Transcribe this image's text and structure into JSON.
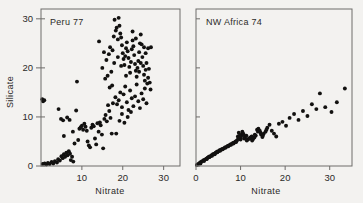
{
  "figure": {
    "background_color": "#f3f2f0",
    "ink_color": "#121110",
    "axis_color": "#6e6c6a"
  },
  "chart_data": [
    {
      "type": "scatter",
      "title": "Peru 77",
      "xlabel": "Nitrate",
      "ylabel": "Silicate",
      "xlim": [
        0,
        34
      ],
      "ylim": [
        0,
        32
      ],
      "xticks": [
        10,
        20,
        30
      ],
      "xticklabels": [
        "10",
        "20",
        "30"
      ],
      "yticks": [
        0,
        10,
        20,
        30
      ],
      "yticklabels": [
        "0",
        "10",
        "20",
        "30"
      ],
      "grid": false,
      "legend": null,
      "marker": "filled-circle",
      "points": [
        [
          0.3,
          13.6
        ],
        [
          0.5,
          13.2
        ],
        [
          0.8,
          13.4
        ],
        [
          0.4,
          0.4
        ],
        [
          0.9,
          0.5
        ],
        [
          1.3,
          0.3
        ],
        [
          1.7,
          0.6
        ],
        [
          2.1,
          0.4
        ],
        [
          2.6,
          0.8
        ],
        [
          3.0,
          0.5
        ],
        [
          3.4,
          1.0
        ],
        [
          3.9,
          0.7
        ],
        [
          4.2,
          1.4
        ],
        [
          4.6,
          1.1
        ],
        [
          5.0,
          2.0
        ],
        [
          5.3,
          1.6
        ],
        [
          5.6,
          2.4
        ],
        [
          5.9,
          1.9
        ],
        [
          6.2,
          2.7
        ],
        [
          6.5,
          2.2
        ],
        [
          6.8,
          3.0
        ],
        [
          7.1,
          2.5
        ],
        [
          7.3,
          1.2
        ],
        [
          7.6,
          1.9
        ],
        [
          7.9,
          0.9
        ],
        [
          4.3,
          11.6
        ],
        [
          4.9,
          9.6
        ],
        [
          5.4,
          9.3
        ],
        [
          5.6,
          6.1
        ],
        [
          6.4,
          9.9
        ],
        [
          7.0,
          9.4
        ],
        [
          7.8,
          7.0
        ],
        [
          8.2,
          4.6
        ],
        [
          8.6,
          11.3
        ],
        [
          8.8,
          17.2
        ],
        [
          9.1,
          5.3
        ],
        [
          9.4,
          7.6
        ],
        [
          9.7,
          7.9
        ],
        [
          10.0,
          8.2
        ],
        [
          10.3,
          7.4
        ],
        [
          10.6,
          8.6
        ],
        [
          10.9,
          8.0
        ],
        [
          11.2,
          7.2
        ],
        [
          11.4,
          5.0
        ],
        [
          11.7,
          4.2
        ],
        [
          12.0,
          3.8
        ],
        [
          12.3,
          7.8
        ],
        [
          12.6,
          8.4
        ],
        [
          12.9,
          8.1
        ],
        [
          13.2,
          5.6
        ],
        [
          13.5,
          4.4
        ],
        [
          13.8,
          8.7
        ],
        [
          14.1,
          7.0
        ],
        [
          14.4,
          8.9
        ],
        [
          14.6,
          8.3
        ],
        [
          14.9,
          6.4
        ],
        [
          15.2,
          3.6
        ],
        [
          15.5,
          9.6
        ],
        [
          15.8,
          10.4
        ],
        [
          16.1,
          9.1
        ],
        [
          16.4,
          12.4
        ],
        [
          16.7,
          11.2
        ],
        [
          17.0,
          9.8
        ],
        [
          17.3,
          6.6
        ],
        [
          17.6,
          12.8
        ],
        [
          14.2,
          25.4
        ],
        [
          15.0,
          20.0
        ],
        [
          15.4,
          23.2
        ],
        [
          15.7,
          17.8
        ],
        [
          16.0,
          21.6
        ],
        [
          16.3,
          18.4
        ],
        [
          16.6,
          22.8
        ],
        [
          16.9,
          24.2
        ],
        [
          17.2,
          19.2
        ],
        [
          17.5,
          23.6
        ],
        [
          17.8,
          26.4
        ],
        [
          18.0,
          29.8
        ],
        [
          18.3,
          27.6
        ],
        [
          18.5,
          28.2
        ],
        [
          18.8,
          25.8
        ],
        [
          19.0,
          30.2
        ],
        [
          19.2,
          28.6
        ],
        [
          19.4,
          27.0
        ],
        [
          19.6,
          26.2
        ],
        [
          19.8,
          24.6
        ],
        [
          20.0,
          23.0
        ],
        [
          20.2,
          21.8
        ],
        [
          20.4,
          20.6
        ],
        [
          20.6,
          22.4
        ],
        [
          20.8,
          24.0
        ],
        [
          21.0,
          25.2
        ],
        [
          21.2,
          23.4
        ],
        [
          21.4,
          22.0
        ],
        [
          21.6,
          20.2
        ],
        [
          21.8,
          19.0
        ],
        [
          22.0,
          21.2
        ],
        [
          22.2,
          23.8
        ],
        [
          22.4,
          25.6
        ],
        [
          22.6,
          24.4
        ],
        [
          22.8,
          22.6
        ],
        [
          23.0,
          20.8
        ],
        [
          23.2,
          19.4
        ],
        [
          23.4,
          18.2
        ],
        [
          23.6,
          20.0
        ],
        [
          23.8,
          21.4
        ],
        [
          24.0,
          23.2
        ],
        [
          24.2,
          25.0
        ],
        [
          24.4,
          26.8
        ],
        [
          24.6,
          24.8
        ],
        [
          24.8,
          22.2
        ],
        [
          25.0,
          20.4
        ],
        [
          25.2,
          18.6
        ],
        [
          25.4,
          17.4
        ],
        [
          25.6,
          19.6
        ],
        [
          25.8,
          21.0
        ],
        [
          26.0,
          16.8
        ],
        [
          26.2,
          18.0
        ],
        [
          26.4,
          19.8
        ],
        [
          26.6,
          17.0
        ],
        [
          26.8,
          15.6
        ],
        [
          18.2,
          14.0
        ],
        [
          18.6,
          12.6
        ],
        [
          19.0,
          13.4
        ],
        [
          19.4,
          15.0
        ],
        [
          19.8,
          12.0
        ],
        [
          20.2,
          14.6
        ],
        [
          20.6,
          16.2
        ],
        [
          21.0,
          13.0
        ],
        [
          21.4,
          11.4
        ],
        [
          21.8,
          15.4
        ],
        [
          22.2,
          13.8
        ],
        [
          22.6,
          12.2
        ],
        [
          23.0,
          14.2
        ],
        [
          23.4,
          16.6
        ],
        [
          23.8,
          13.2
        ],
        [
          24.2,
          11.8
        ],
        [
          24.6,
          14.8
        ],
        [
          25.0,
          13.6
        ],
        [
          25.4,
          15.8
        ],
        [
          25.8,
          12.8
        ],
        [
          18.4,
          6.6
        ],
        [
          19.2,
          9.2
        ],
        [
          19.8,
          10.6
        ],
        [
          20.4,
          8.8
        ],
        [
          21.2,
          10.0
        ],
        [
          22.0,
          11.0
        ],
        [
          24.0,
          19.2
        ],
        [
          25.2,
          24.2
        ],
        [
          26.2,
          24.0
        ],
        [
          26.9,
          24.2
        ],
        [
          22.4,
          27.4
        ],
        [
          23.2,
          26.0
        ],
        [
          24.4,
          21.0
        ],
        [
          25.6,
          23.0
        ],
        [
          20.8,
          18.4
        ],
        [
          19.6,
          20.4
        ],
        [
          17.9,
          21.0
        ],
        [
          18.8,
          22.2
        ],
        [
          17.4,
          16.4
        ],
        [
          16.8,
          16.0
        ]
      ]
    },
    {
      "type": "scatter",
      "title": "NW Africa 74",
      "xlabel": "Nitrate",
      "ylabel": null,
      "xlim": [
        0,
        35
      ],
      "ylim": [
        0,
        32
      ],
      "xticks": [
        0,
        10,
        20,
        30
      ],
      "xticklabels": [
        "0",
        "10",
        "20",
        "30"
      ],
      "yticks": [
        0,
        10,
        20,
        30
      ],
      "yticklabels": [],
      "grid": false,
      "legend": null,
      "marker": "filled-circle",
      "points": [
        [
          0.2,
          0.2
        ],
        [
          0.5,
          0.4
        ],
        [
          0.8,
          0.6
        ],
        [
          1.1,
          0.8
        ],
        [
          1.4,
          1.0
        ],
        [
          1.7,
          1.2
        ],
        [
          2.0,
          1.3
        ],
        [
          2.3,
          1.5
        ],
        [
          2.6,
          1.7
        ],
        [
          2.9,
          1.9
        ],
        [
          3.2,
          2.0
        ],
        [
          3.5,
          2.2
        ],
        [
          3.8,
          2.4
        ],
        [
          4.1,
          2.5
        ],
        [
          4.4,
          2.7
        ],
        [
          4.7,
          2.9
        ],
        [
          5.0,
          3.0
        ],
        [
          5.3,
          3.2
        ],
        [
          5.6,
          3.3
        ],
        [
          5.9,
          3.5
        ],
        [
          6.2,
          3.6
        ],
        [
          6.5,
          3.8
        ],
        [
          6.8,
          3.9
        ],
        [
          7.1,
          4.1
        ],
        [
          7.4,
          4.2
        ],
        [
          7.7,
          4.4
        ],
        [
          8.0,
          4.5
        ],
        [
          8.3,
          4.7
        ],
        [
          8.6,
          4.8
        ],
        [
          8.9,
          5.0
        ],
        [
          9.2,
          5.2
        ],
        [
          9.4,
          6.0
        ],
        [
          9.6,
          6.8
        ],
        [
          9.8,
          6.2
        ],
        [
          10.0,
          5.4
        ],
        [
          10.2,
          6.4
        ],
        [
          10.4,
          7.0
        ],
        [
          10.6,
          6.6
        ],
        [
          10.8,
          5.6
        ],
        [
          11.0,
          5.8
        ],
        [
          11.3,
          6.2
        ],
        [
          11.6,
          5.4
        ],
        [
          11.9,
          5.6
        ],
        [
          12.2,
          5.8
        ],
        [
          12.5,
          6.0
        ],
        [
          12.8,
          5.5
        ],
        [
          13.1,
          5.8
        ],
        [
          13.4,
          6.2
        ],
        [
          13.7,
          7.4
        ],
        [
          14.0,
          7.6
        ],
        [
          14.3,
          7.2
        ],
        [
          14.6,
          6.4
        ],
        [
          14.9,
          5.9
        ],
        [
          15.2,
          6.6
        ],
        [
          15.6,
          7.0
        ],
        [
          16.0,
          7.8
        ],
        [
          16.5,
          8.4
        ],
        [
          17.0,
          7.2
        ],
        [
          17.5,
          6.6
        ],
        [
          18.0,
          6.0
        ],
        [
          18.6,
          8.6
        ],
        [
          19.4,
          9.0
        ],
        [
          20.2,
          8.2
        ],
        [
          21.0,
          9.8
        ],
        [
          22.0,
          10.6
        ],
        [
          23.0,
          9.4
        ],
        [
          24.0,
          11.2
        ],
        [
          25.0,
          10.2
        ],
        [
          26.0,
          12.6
        ],
        [
          27.0,
          11.6
        ],
        [
          27.8,
          14.8
        ],
        [
          29.0,
          12.0
        ],
        [
          30.4,
          11.0
        ],
        [
          31.6,
          13.0
        ],
        [
          33.4,
          15.8
        ],
        [
          1.0,
          0.5
        ],
        [
          1.8,
          1.0
        ],
        [
          2.4,
          1.4
        ],
        [
          3.0,
          1.8
        ],
        [
          3.6,
          2.1
        ],
        [
          4.2,
          2.4
        ],
        [
          4.8,
          2.8
        ],
        [
          5.4,
          3.1
        ],
        [
          6.0,
          3.4
        ],
        [
          6.6,
          3.7
        ],
        [
          7.2,
          4.0
        ],
        [
          7.8,
          4.3
        ],
        [
          8.4,
          4.6
        ],
        [
          9.0,
          4.9
        ],
        [
          9.5,
          5.6
        ],
        [
          10.1,
          6.0
        ],
        [
          10.7,
          6.3
        ],
        [
          11.4,
          5.2
        ],
        [
          12.0,
          5.6
        ],
        [
          12.6,
          5.2
        ],
        [
          13.2,
          6.4
        ],
        [
          13.9,
          7.0
        ],
        [
          14.5,
          6.8
        ],
        [
          15.0,
          6.2
        ],
        [
          15.8,
          7.4
        ]
      ]
    }
  ]
}
